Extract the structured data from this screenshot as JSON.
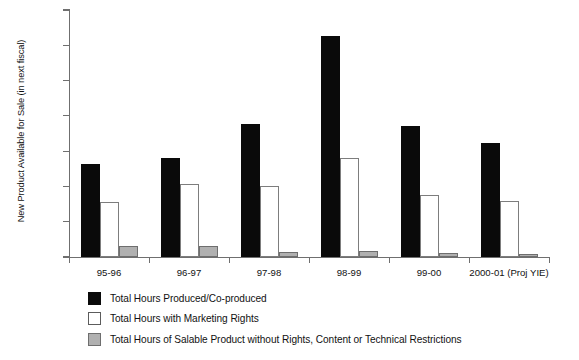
{
  "chart_data": {
    "type": "bar",
    "title": "",
    "xlabel": "",
    "ylabel": "New Product Available for Sale (in next fiscal)",
    "ylim": [
      0,
      1400
    ],
    "ytick_step": 200,
    "ytick_labels": [
      "1400.0",
      "1200.0",
      "1000.0",
      "800.0",
      "600.0",
      "400.0",
      "200.0",
      "0.0"
    ],
    "ytick_values": [
      1400,
      1200,
      1000,
      800,
      600,
      400,
      200,
      0
    ],
    "grid": false,
    "legend_position": "bottom-left",
    "categories": [
      "95-96",
      "96-97",
      "97-98",
      "98-99",
      "99-00",
      "2000-01 (Proj YIE)"
    ],
    "series": [
      {
        "name": "Total Hours Produced/Co-produced",
        "color": "#0a0a0a",
        "values": [
          525,
          560,
          755,
          1255,
          740,
          645
        ]
      },
      {
        "name": "Total Hours with Marketing Rights",
        "color": "#ffffff",
        "values": [
          310,
          415,
          400,
          560,
          350,
          315
        ]
      },
      {
        "name": "Total Hours of Salable Product without Rights, Content or Technical Restrictions",
        "color": "#b0b0b0",
        "values": [
          60,
          60,
          30,
          35,
          25,
          15
        ]
      }
    ]
  },
  "legend": {
    "items": [
      {
        "label": "Total Hours Produced/Co-produced",
        "swatch": "produced"
      },
      {
        "label": "Total Hours with Marketing Rights",
        "swatch": "rights"
      },
      {
        "label": "Total Hours of Salable Product without Rights, Content or Technical Restrictions",
        "swatch": "salable"
      }
    ]
  }
}
